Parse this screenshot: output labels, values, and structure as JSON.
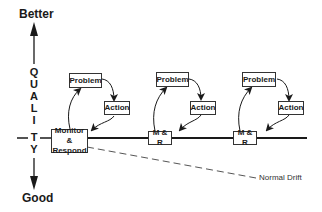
{
  "axis": {
    "top_label": "Better",
    "bottom_label": "Good",
    "letters": [
      "Q",
      "U",
      "A",
      "L",
      "I",
      "T",
      "Y"
    ]
  },
  "nodes": {
    "monitor": "Monitor & Respond",
    "monitor_line1": "Monitor &",
    "monitor_line2": "Respond",
    "mr1": "M & R",
    "mr2": "M & R",
    "cycles": [
      {
        "problem": "Problem",
        "action": "Action"
      },
      {
        "problem": "Problem",
        "action": "Action"
      },
      {
        "problem": "Problem",
        "action": "Action"
      }
    ]
  },
  "annotation": {
    "drift": "Normal Drift"
  },
  "colors": {
    "line": "#1a1a1a",
    "dash": "#555555"
  }
}
